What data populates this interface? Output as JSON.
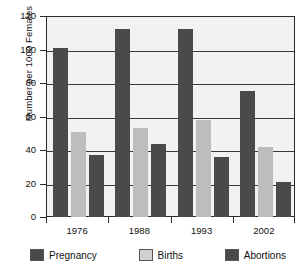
{
  "chart_data": {
    "type": "bar",
    "title": "",
    "xlabel": "",
    "ylabel": "Number per 1000 Females",
    "categories": [
      "1976",
      "1988",
      "1993",
      "2002"
    ],
    "series": [
      {
        "name": "Pregnancy",
        "color": "#4a4a4a",
        "values": [
          101,
          112.5,
          112.5,
          75
        ]
      },
      {
        "name": "Births",
        "color": "#bdbdbd",
        "values": [
          51,
          53,
          58,
          42
        ]
      },
      {
        "name": "Abortions",
        "color": "#4a4a4a",
        "values": [
          37,
          43.5,
          36,
          21
        ]
      }
    ],
    "ylim": [
      0,
      120
    ],
    "yticks": [
      0,
      20,
      40,
      60,
      80,
      100,
      120
    ],
    "ytick_labels": [
      "0",
      "20",
      "40",
      "60",
      "80",
      "100",
      "120"
    ],
    "grid": true,
    "legend_position": "bottom",
    "plot_background": "#f2f2f0",
    "axis_color": "#2b2b2b"
  }
}
